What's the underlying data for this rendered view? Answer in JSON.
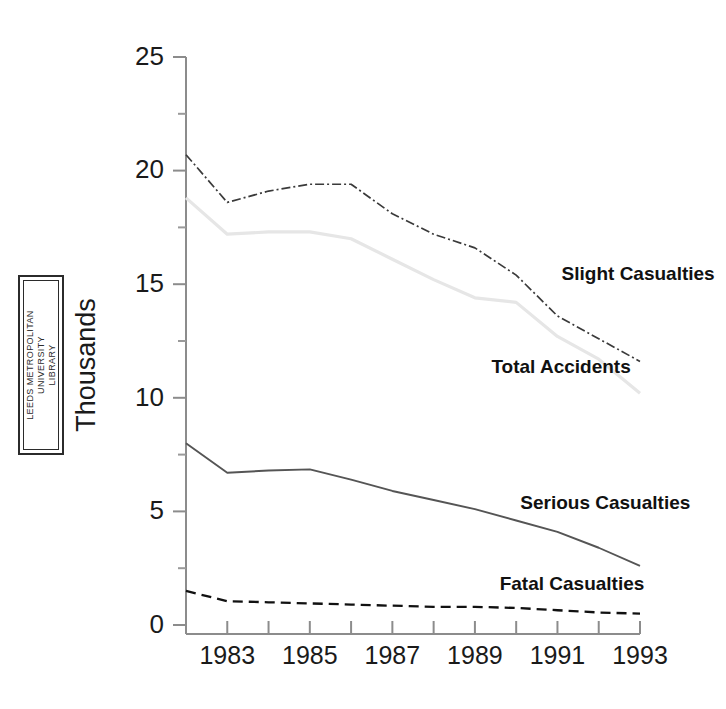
{
  "figure": {
    "width": 726,
    "height": 709,
    "background": "#ffffff"
  },
  "stamp": {
    "name": "leeds-metropolitan-university-library-stamp",
    "line1": "LEEDS METROPOLITAN",
    "line2": "UNIVERSITY",
    "line3": "LIBRARY",
    "border_color": "#2b2b2b"
  },
  "chart_data": {
    "type": "line",
    "title": "",
    "subtitle": "",
    "xlabel": "",
    "ylabel": "Thousands",
    "xlim": [
      1982,
      1993
    ],
    "ylim": [
      0,
      25
    ],
    "grid": false,
    "legend_position": "inline-right",
    "x": [
      1982,
      1983,
      1984,
      1985,
      1986,
      1987,
      1988,
      1989,
      1990,
      1991,
      1992,
      1993
    ],
    "x_tick_values": [
      1982,
      1983,
      1984,
      1985,
      1986,
      1987,
      1988,
      1989,
      1990,
      1991,
      1992,
      1993
    ],
    "x_tick_labels": [
      "",
      "1983",
      "",
      "1985",
      "",
      "1987",
      "",
      "1989",
      "",
      "1991",
      "",
      "1993"
    ],
    "y_tick_values": [
      0,
      2.5,
      5,
      7.5,
      10,
      12.5,
      15,
      17.5,
      20,
      22.5,
      25
    ],
    "y_tick_labels": [
      "0",
      "",
      "5",
      "",
      "10",
      "",
      "15",
      "",
      "20",
      "",
      "25"
    ],
    "series": [
      {
        "name": "Slight Casualties",
        "color": "#3a3a3a",
        "style": "dash-dot",
        "label_x": 1991.1,
        "label_y": 15.2,
        "values": [
          20.7,
          18.6,
          19.1,
          19.4,
          19.4,
          18.1,
          17.2,
          16.6,
          15.4,
          13.6,
          12.6,
          11.6
        ]
      },
      {
        "name": "Total Accidents",
        "color": "#e6e6e6",
        "style": "solid",
        "label_x": 1989.4,
        "label_y": 11.1,
        "values": [
          18.8,
          17.2,
          17.3,
          17.3,
          17.0,
          16.1,
          15.2,
          14.4,
          14.2,
          12.7,
          11.7,
          10.2
        ]
      },
      {
        "name": "Serious Casualties",
        "color": "#555555",
        "style": "solid",
        "label_x": 1990.1,
        "label_y": 5.1,
        "values": [
          8.0,
          6.7,
          6.8,
          6.85,
          6.4,
          5.9,
          5.5,
          5.1,
          4.6,
          4.1,
          3.4,
          2.6
        ]
      },
      {
        "name": "Fatal Casualties",
        "color": "#111111",
        "style": "dashed",
        "label_x": 1989.6,
        "label_y": 1.55,
        "values": [
          1.5,
          1.05,
          1.0,
          0.95,
          0.9,
          0.85,
          0.8,
          0.8,
          0.75,
          0.65,
          0.55,
          0.5
        ]
      }
    ]
  }
}
